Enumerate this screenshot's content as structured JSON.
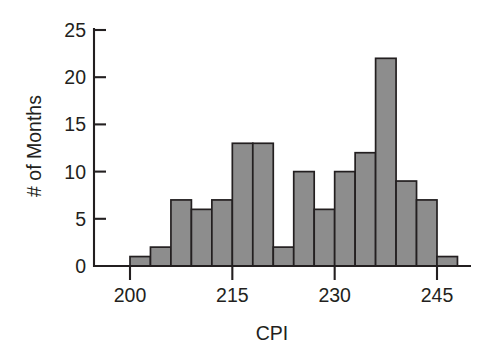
{
  "chart_data": {
    "type": "bar",
    "title": "",
    "subtitle": "",
    "xlabel": "CPI",
    "ylabel": "# of Months",
    "xlim": [
      197,
      251
    ],
    "ylim": [
      0,
      25
    ],
    "bin_width": 3,
    "bin_start": 200,
    "grid": false,
    "legend": null,
    "categories": [
      "200-203",
      "203-206",
      "206-209",
      "209-212",
      "212-215",
      "215-218",
      "218-221",
      "221-224",
      "224-227",
      "227-230",
      "230-233",
      "233-236",
      "236-239",
      "239-242",
      "242-245",
      "245-248"
    ],
    "bin_left_edges": [
      200,
      203,
      206,
      209,
      212,
      215,
      218,
      221,
      224,
      227,
      230,
      233,
      236,
      239,
      242,
      245
    ],
    "values": [
      1,
      2,
      7,
      6,
      7,
      13,
      13,
      2,
      10,
      6,
      10,
      12,
      22,
      9,
      7,
      1
    ],
    "x_ticks": [
      200,
      215,
      230,
      245
    ],
    "x_tick_labels": [
      "200",
      "215",
      "230",
      "245"
    ],
    "y_ticks": [
      0,
      5,
      10,
      15,
      20,
      25
    ],
    "y_tick_labels": [
      "0",
      "5",
      "10",
      "15",
      "20",
      "25"
    ],
    "bar_fill_color": "#8d8d8d",
    "bar_edge_color": "#231f20",
    "axis_color": "#231f20",
    "background_color": "#ffffff"
  }
}
